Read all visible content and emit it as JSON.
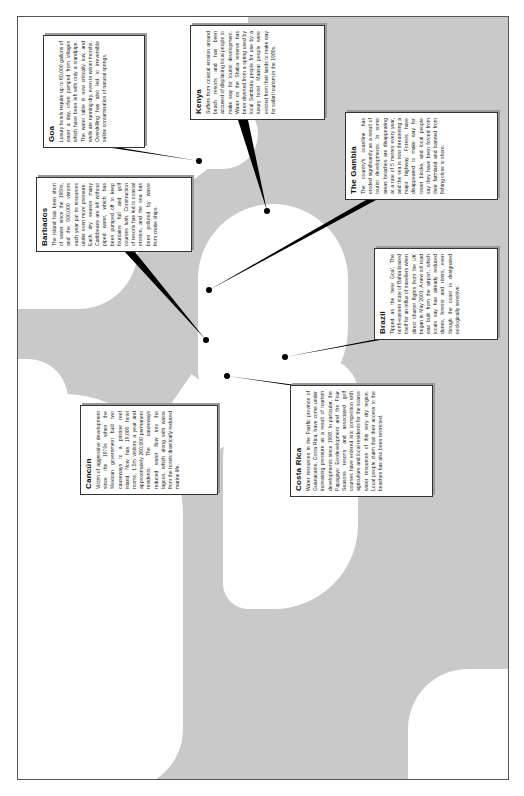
{
  "figure": {
    "orientation": "rotated -90 degrees",
    "background_ocean_color": "#c9c9c9",
    "land_color": "#ffffff",
    "callout_line_color": "#000000"
  },
  "callouts": [
    {
      "id": "goa",
      "title": "Goa",
      "text": "Luxury hotels require up to 60,000 gallons of water a day, often pumped from villages which have been left with only a standpipe. The water table is now critically low, and wells are running dry, even in winter months. Overdrilling has also led to irreversible saline contamination of natural springs."
    },
    {
      "id": "kenya",
      "title": "Kenya",
      "text": "Suffers from coastal erosion around beach resorts and has been accused of displacing local people to make way for tourist development. Water on the Shaba reserve has been diverted from a spring used by local Samburu people for use by a luxury hotel. Maasai people were evicted from their lands to make way for safari tourism in the 1980s."
    },
    {
      "id": "gambia",
      "title": "The Gambia",
      "text": "The country's coastline has eroded significantly as a result of tourist developments. In some areas beaches are disappearing at a rate of 5 metres every year, and the sea is now threatening a major highway. Forests have disappeared to make way for tower blocks, and local people say they have been forced from their farmland and banned from fishing close to shore."
    },
    {
      "id": "barbados",
      "title": "Barbados",
      "text": "The island has been short of water since the 1950s, and the 500,000 visitors each year put its resources under even more pressure. Each dry season many Caribbeans are left without piped water, which has been pumped off to keep fountains full and golf courses lush. Construction of resorts has led to coastal erosion, and the sea has been polluted by waste from cruise ships."
    },
    {
      "id": "brazil",
      "title": "Brazil",
      "text": "Tipped as the 'new Goa', The north-eastern state of Bahia braced itself for an influx of travellers when direct charter flights from the UK began in May 2001. A new toll road was built from the airport, which locals say has already reduced dunes, forests and rivers, even though the coast is designated ecologically sensitive."
    },
    {
      "id": "cancun",
      "title": "Cancún",
      "text": "Victim of aggressive development since the 1970s when the Mexican government built two causeways to a pristine reef island. Now has 19,000 hotel rooms, 1.5m visitors a year and approximately 260,000 permanent residents. The causeways reduced water flow into the lagoon, which along with waste from the hotels drastically reduced marine life."
    },
    {
      "id": "costa_rica",
      "title": "Costa Rica",
      "text": "Water resources in the Pacific province of Guanacaste, Costa Rica, have come under increasing pressure as a result of tourism developments since 1998. In particular, the Papagayo Ecodevelopment and the Four Seasons resorts and associated golf courses have entered into competition with agriculture and local residents for the scarce water resources of this very dry region. Local people claim that their access to the beaches has also been restricted."
    }
  ]
}
